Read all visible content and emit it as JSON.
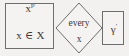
{
  "diagram": {
    "type": "flowchart-fragment",
    "background_color": "#f2f1ef",
    "stroke_color": "#6e6e6e",
    "text_color": "#3a3a3a",
    "nodes": [
      {
        "id": "input-box",
        "shape": "rectangle",
        "name": "input-state-box",
        "lines": [
          {
            "base": "x",
            "superscript": "p′"
          },
          {
            "base": "x ∈ X",
            "superscript": ""
          }
        ]
      },
      {
        "id": "decision",
        "shape": "diamond",
        "name": "every-x-decision",
        "lines": [
          {
            "base": "every",
            "superscript": ""
          },
          {
            "base": "x",
            "superscript": ""
          }
        ]
      },
      {
        "id": "gamma-box",
        "shape": "rectangle",
        "name": "gamma-output-box",
        "lines": [
          {
            "base": "γ",
            "superscript": "′"
          }
        ]
      }
    ],
    "labels": {
      "input_superscript_base": "x",
      "input_superscript": "p′",
      "input_membership": "x ∈ X",
      "decision_top": "every",
      "decision_bottom": "x",
      "gamma_base": "γ",
      "gamma_superscript": "′"
    }
  }
}
